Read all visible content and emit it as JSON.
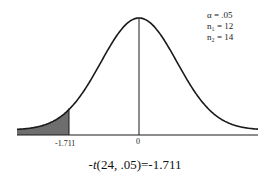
{
  "chart_data": {
    "type": "area",
    "title": "",
    "xlabel": "",
    "ylabel": "",
    "x_ticks": [
      {
        "label": "-1.711",
        "value": -1.711
      },
      {
        "label": "0",
        "value": 0
      }
    ],
    "shaded_region": {
      "from": "-inf",
      "to": -1.711,
      "color": "#6e6e6e"
    },
    "center_line": 0,
    "curve_color": "#1a1a1a",
    "legend": [
      {
        "symbol": "α",
        "value": ".05"
      },
      {
        "symbol": "n₁",
        "value": "12"
      },
      {
        "symbol": "n₂",
        "value": "14"
      }
    ],
    "caption": "-t(24, .05)=-1.711",
    "grid": false
  },
  "legend": {
    "alpha": "α  = .05",
    "n1": "n₁ = 12",
    "n2": "n₂ = 14"
  },
  "ticks": {
    "critical": "-1.711",
    "zero": "0"
  },
  "caption": {
    "prefix": "-",
    "t": "t",
    "rest": "(24, .05)=-1.711"
  }
}
